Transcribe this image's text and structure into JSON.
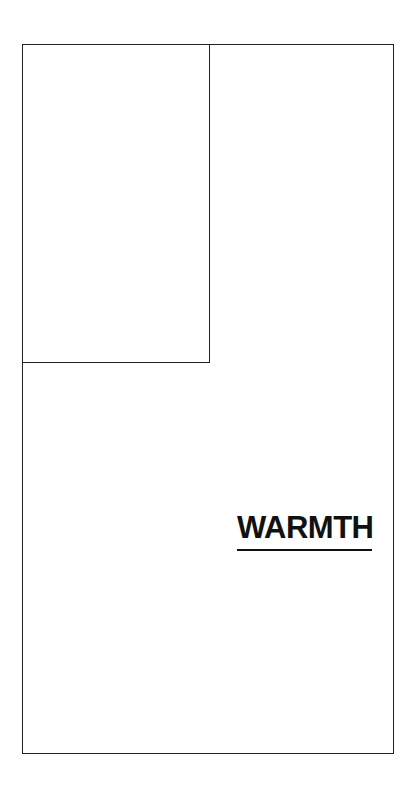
{
  "diagram": {
    "label": "WARMTH",
    "colors": {
      "line": "#222222",
      "text": "#111111",
      "background": "#ffffff"
    }
  }
}
